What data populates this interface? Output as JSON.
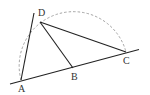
{
  "diagram": {
    "type": "geometry",
    "points": {
      "A": {
        "label": "A",
        "x": 21,
        "y": 80
      },
      "B": {
        "label": "B",
        "x": 73,
        "y": 68
      },
      "C": {
        "label": "C",
        "x": 126,
        "y": 52
      },
      "D": {
        "label": "D",
        "x": 40,
        "y": 22
      }
    },
    "segments": [
      "AD",
      "DB",
      "DC",
      "line through A, B, C"
    ],
    "arc": {
      "style": "dashed",
      "center": "B",
      "from": "A",
      "through": "D",
      "to": "C"
    },
    "colors": {
      "line": "#222222",
      "arc": "#999999",
      "label": "#333333"
    }
  }
}
